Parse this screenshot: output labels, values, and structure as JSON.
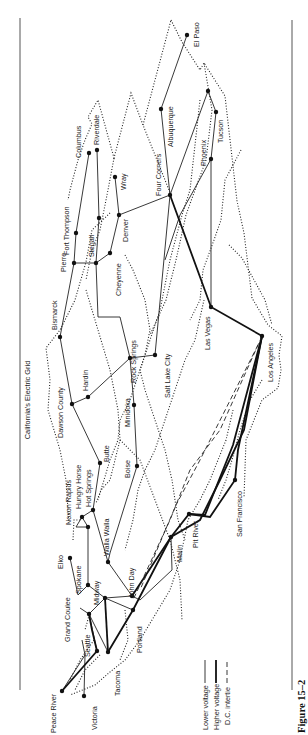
{
  "figure": {
    "title": "California's Electric Grid",
    "caption": "Figure 15–2",
    "orientation": "rotated 90° counter-clockwise"
  },
  "legend": {
    "items": [
      {
        "label": "Lower voltage",
        "style": "thin-solid"
      },
      {
        "label": "Higher voltage",
        "style": "thick-solid"
      },
      {
        "label": "D.C. intertie",
        "style": "dashed"
      }
    ]
  },
  "cities": [
    {
      "name": "El Paso",
      "x": 187,
      "y": 35,
      "lx": 199,
      "ly": 30
    },
    {
      "name": "Albuquerque",
      "x": 161,
      "y": 109,
      "lx": 173,
      "ly": 128
    },
    {
      "name": "Tucson",
      "x": 216,
      "y": 112,
      "lx": 223,
      "ly": 125
    },
    {
      "name": "Phoenix",
      "x": 211,
      "y": 159,
      "lx": 206,
      "ly": 151
    },
    {
      "name": "Four Corners",
      "x": 170,
      "y": 195,
      "lx": 161,
      "ly": 175
    },
    {
      "name": "Riverdale",
      "x": 97,
      "y": 150,
      "lx": 99,
      "ly": 134
    },
    {
      "name": "Columbus",
      "x": 89,
      "y": 153,
      "lx": 81,
      "ly": 141
    },
    {
      "name": "Wray",
      "x": 115,
      "y": 177,
      "lx": 126,
      "ly": 182
    },
    {
      "name": "Denver",
      "x": 119,
      "y": 215,
      "lx": 128,
      "ly": 226
    },
    {
      "name": "Fort Thompson",
      "x": 76,
      "y": 233,
      "lx": 69,
      "ly": 222
    },
    {
      "name": "Stegall",
      "x": 99,
      "y": 218,
      "lx": 94,
      "ly": 238
    },
    {
      "name": "Pierre",
      "x": 74,
      "y": 263,
      "lx": 66,
      "ly": 255
    },
    {
      "name": "Cheyenne",
      "x": 110,
      "y": 253,
      "lx": 121,
      "ly": 272
    },
    {
      "name": "Bismarck",
      "x": 60,
      "y": 337,
      "lx": 57,
      "ly": 323
    },
    {
      "name": "Rock Springs",
      "x": 130,
      "y": 358,
      "lx": 136,
      "ly": 340
    },
    {
      "name": "Salt Lake City",
      "x": 155,
      "y": 355,
      "lx": 170,
      "ly": 345
    },
    {
      "name": "Las Vegas",
      "x": 210,
      "y": 307,
      "lx": 209,
      "ly": 322
    },
    {
      "name": "Los Angeles",
      "x": 262,
      "y": 336,
      "lx": 271,
      "ly": 345
    },
    {
      "name": "Dawson County",
      "x": 72,
      "y": 404,
      "lx": 63,
      "ly": 378
    },
    {
      "name": "Hardin",
      "x": 88,
      "y": 397,
      "lx": 88,
      "ly": 381
    },
    {
      "name": "Minidoka",
      "x": 134,
      "y": 405,
      "lx": 130,
      "ly": 420
    },
    {
      "name": "Butte",
      "x": 100,
      "y": 463,
      "lx": 109,
      "ly": 462
    },
    {
      "name": "Boise",
      "x": 137,
      "y": 466,
      "lx": 130,
      "ly": 473
    },
    {
      "name": "Hot Springs",
      "x": 93,
      "y": 510,
      "lx": 91,
      "ly": 491
    },
    {
      "name": "Hungry Horse",
      "x": 82,
      "y": 517,
      "lx": 81,
      "ly": 491
    },
    {
      "name": "Noxon Rapids",
      "x": 88,
      "y": 527,
      "lx": 71,
      "ly": 510
    },
    {
      "name": "Walla Walla",
      "x": 108,
      "y": 562,
      "lx": 109,
      "ly": 544
    },
    {
      "name": "Elko",
      "x": 70,
      "y": 558,
      "lx": 62,
      "ly": 566
    },
    {
      "name": "Spokane",
      "x": 87,
      "y": 585,
      "lx": 81,
      "ly": 576
    },
    {
      "name": "Midway",
      "x": 105,
      "y": 598,
      "lx": 99,
      "ly": 590
    },
    {
      "name": "John Day",
      "x": 132,
      "y": 596,
      "lx": 134,
      "ly": 581
    },
    {
      "name": "Malin",
      "x": 171,
      "y": 537,
      "lx": 182,
      "ly": 549
    },
    {
      "name": "Pit River",
      "x": 189,
      "y": 514,
      "lx": 198,
      "ly": 529
    },
    {
      "name": "San Francisco",
      "x": 235,
      "y": 480,
      "lx": 242,
      "ly": 503
    },
    {
      "name": "Grand Coulee",
      "x": 89,
      "y": 614,
      "lx": 70,
      "ly": 612
    },
    {
      "name": "Seattle",
      "x": 97,
      "y": 651,
      "lx": 90,
      "ly": 638
    },
    {
      "name": "Tacoma",
      "x": 108,
      "y": 652,
      "lx": 120,
      "ly": 674
    },
    {
      "name": "Portland",
      "x": 133,
      "y": 610,
      "lx": 142,
      "ly": 624
    },
    {
      "name": "Peace River",
      "x": 62,
      "y": 691,
      "lx": 56,
      "ly": 699
    },
    {
      "name": "Victoria",
      "x": 84,
      "y": 696,
      "lx": 97,
      "ly": 700
    }
  ]
}
